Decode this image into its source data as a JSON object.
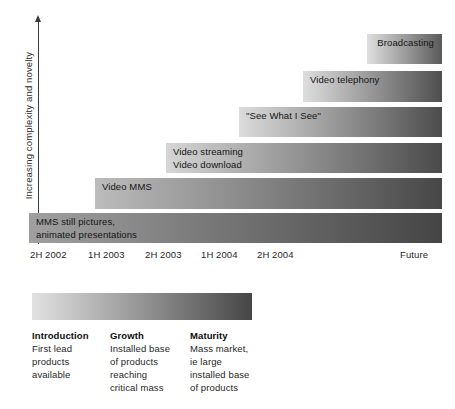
{
  "chart_data": {
    "type": "bar",
    "title": "",
    "xlabel": "",
    "ylabel": "Increasing complexity and novelty",
    "orientation": "horizontal",
    "grid": false,
    "legend_position": "below",
    "x_tick_labels": [
      "2H 2002",
      "1H 2003",
      "2H 2003",
      "1H 2004",
      "2H 2004",
      "Future"
    ],
    "categories": [
      "MMS still pictures,\nanimated presentations",
      "Video MMS",
      "Video streaming\nVideo download",
      "\"See What I See\"",
      "Video telephony",
      "Broadcasting"
    ],
    "bars": [
      {
        "label": "MMS still pictures,\nanimated presentations",
        "start": "2H 2002",
        "end": "Future",
        "left_px": 29,
        "right_px": 442,
        "top_px": 213,
        "height_px": 30,
        "label_align": "left",
        "gradient_from": "#a0a0a0",
        "gradient_to": "#454545"
      },
      {
        "label": "Video MMS",
        "start": "1H 2003",
        "end": "Future",
        "left_px": 95,
        "right_px": 442,
        "top_px": 178,
        "height_px": 31,
        "label_align": "left",
        "gradient_from": "#bcbcbc",
        "gradient_to": "#474747"
      },
      {
        "label": "Video streaming\nVideo download",
        "start": "2H 2003",
        "end": "Future",
        "left_px": 166,
        "right_px": 442,
        "top_px": 143,
        "height_px": 30,
        "label_align": "left",
        "gradient_from": "#d6d6d6",
        "gradient_to": "#4a4a4a"
      },
      {
        "label": "\"See What I See\"",
        "start": "1H 2004",
        "end": "Future",
        "left_px": 239,
        "right_px": 442,
        "top_px": 107,
        "height_px": 30,
        "label_align": "left",
        "gradient_from": "#dcdcdc",
        "gradient_to": "#4c4c4c"
      },
      {
        "label": "Video telephony",
        "start": "2H 2004",
        "end": "Future",
        "left_px": 303,
        "right_px": 442,
        "top_px": 71,
        "height_px": 31,
        "label_align": "left",
        "gradient_from": "#dedede",
        "gradient_to": "#4e4e4e"
      },
      {
        "label": "Broadcasting",
        "start": "Future",
        "end": "Future",
        "left_px": 367,
        "right_px": 442,
        "top_px": 34,
        "height_px": 30,
        "label_align": "right",
        "gradient_from": "#dfdfdf",
        "gradient_to": "#5a5a5a"
      }
    ],
    "tick_positions_px": [
      30,
      88,
      145,
      201,
      257,
      400
    ]
  },
  "legend": {
    "gradient_from": "#e2e2e2",
    "gradient_to": "#464646",
    "columns": [
      {
        "title": "Introduction",
        "body": "First lead\nproducts\navailable",
        "left_px": 32
      },
      {
        "title": "Growth",
        "body": "Installed base\nof products\nreaching\ncritical mass",
        "left_px": 110
      },
      {
        "title": "Maturity",
        "body": "Mass market,\nie large\ninstalled base\nof products",
        "left_px": 190
      }
    ]
  },
  "colors": {
    "axis": "#3a3a3a",
    "text": "#1a1a1a",
    "background": "#ffffff"
  }
}
